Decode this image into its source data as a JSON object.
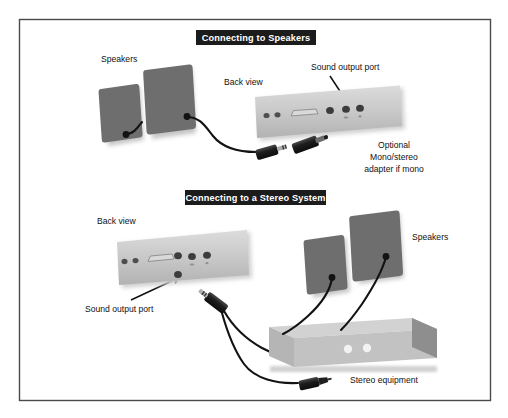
{
  "figure": {
    "frame_color": "#4a4a4a",
    "background_color": "#ffffff"
  },
  "palette": {
    "speaker_gray": "#6e6e6e",
    "speaker_shadow": "#c9c9c9",
    "panel_gray": "#c4c4c4",
    "panel_light": "#d7d7d7",
    "cable_black": "#131313",
    "banner_black": "#1c1c1c",
    "banner_text": "#ffffff",
    "label_text": "#121212",
    "stereo_top": "#d2d2d2",
    "stereo_front": "#bdbdbd",
    "stereo_side": "#8e8e8e",
    "knob_white": "#f2f2f2"
  },
  "sections": [
    {
      "id": "speakers-section",
      "banner": "Connecting to Speakers",
      "labels": [
        {
          "name": "speakers-label",
          "text": "Speakers"
        },
        {
          "name": "back-view-label",
          "text": "Back view"
        },
        {
          "name": "sound-output-port-label",
          "text": "Sound output port"
        }
      ],
      "note": {
        "name": "optional-adapter-note",
        "lines": [
          "Optional",
          "Mono/stereo",
          "adapter if mono"
        ]
      },
      "components": [
        {
          "name": "speaker-left",
          "type": "speaker"
        },
        {
          "name": "speaker-right",
          "type": "speaker"
        },
        {
          "name": "computer-back-panel",
          "type": "back-panel"
        },
        {
          "name": "audio-plug",
          "type": "mini-plug"
        },
        {
          "name": "mono-stereo-adapter",
          "type": "adapter"
        }
      ],
      "ports": {
        "small_dots": 2,
        "serial_connector": 1,
        "audio_jacks": 3,
        "highlighted_jack_index": 2
      }
    },
    {
      "id": "stereo-section",
      "banner": "Connecting to a Stereo System",
      "labels": [
        {
          "name": "back-view-label",
          "text": "Back view"
        },
        {
          "name": "sound-output-port-label",
          "text": "Sound output port"
        },
        {
          "name": "speakers-label",
          "text": "Speakers"
        },
        {
          "name": "stereo-equipment-label",
          "text": "Stereo equipment"
        }
      ],
      "components": [
        {
          "name": "computer-back-panel",
          "type": "back-panel"
        },
        {
          "name": "audio-plug",
          "type": "mini-plug"
        },
        {
          "name": "rca-plug-top",
          "type": "rca-plug"
        },
        {
          "name": "rca-plug-bottom",
          "type": "rca-plug"
        },
        {
          "name": "stereo-equipment-box",
          "type": "stereo-box"
        },
        {
          "name": "speaker-left",
          "type": "speaker"
        },
        {
          "name": "speaker-right",
          "type": "speaker"
        }
      ],
      "ports": {
        "small_dots": 2,
        "serial_connector": 1,
        "audio_jacks": 3,
        "highlighted_jack_index": 1
      },
      "stereo_box": {
        "knobs": 2
      }
    }
  ]
}
